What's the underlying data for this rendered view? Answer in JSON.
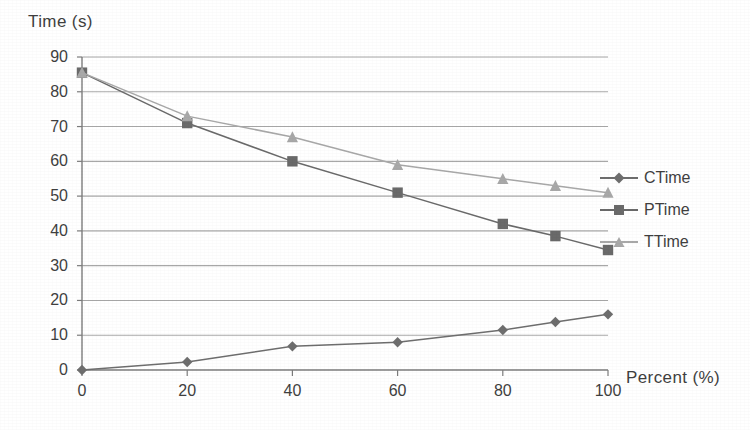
{
  "chart_data": {
    "type": "line",
    "title": "",
    "xlabel": "Percent (%)",
    "ylabel": "Time (s)",
    "xlim": [
      0,
      100
    ],
    "ylim": [
      0,
      90
    ],
    "xticks": [
      0,
      20,
      40,
      60,
      80,
      100
    ],
    "yticks": [
      0,
      10,
      20,
      30,
      40,
      50,
      60,
      70,
      80,
      90
    ],
    "grid": "horizontal",
    "legend_position": "right",
    "x": [
      0,
      20,
      40,
      60,
      80,
      90,
      100
    ],
    "series": [
      {
        "name": "CTime",
        "marker": "diamond",
        "color": "#6e6e6e",
        "values": [
          0,
          2.3,
          6.8,
          8.0,
          11.5,
          13.8,
          16.0
        ]
      },
      {
        "name": "PTime",
        "marker": "square",
        "color": "#6a6a6a",
        "values": [
          85.5,
          71.0,
          60.0,
          51.0,
          42.0,
          38.5,
          34.5
        ]
      },
      {
        "name": "TTime",
        "marker": "triangle",
        "color": "#a8a8a8",
        "values": [
          85.5,
          73.0,
          67.0,
          59.0,
          55.0,
          53.0,
          51.0
        ]
      }
    ]
  },
  "axis": {
    "y_title": "Time (s)",
    "x_title": "Percent (%)",
    "y_tick_labels": [
      "90",
      "80",
      "70",
      "60",
      "50",
      "40",
      "30",
      "20",
      "10",
      "0"
    ],
    "x_tick_labels": [
      "0",
      "20",
      "40",
      "60",
      "80",
      "100"
    ]
  },
  "legend": {
    "items": [
      {
        "label": "CTime"
      },
      {
        "label": "PTime"
      },
      {
        "label": "TTime"
      }
    ]
  },
  "colors": {
    "axis": "#7c7c7c",
    "grid": "#9a9a9a",
    "ctime": "#6e6e6e",
    "ptime": "#6a6a6a",
    "ttime": "#a8a8a8",
    "text": "#3f3f3f",
    "background": "#ffffff"
  }
}
